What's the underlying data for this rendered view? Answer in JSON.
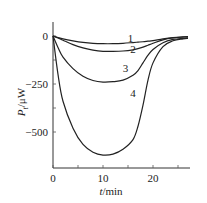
{
  "chart_data": {
    "type": "line",
    "title": "",
    "xlabel": "t/min",
    "ylabel": "P_t/μW",
    "xlim": [
      0,
      27
    ],
    "ylim": [
      -660,
      80
    ],
    "x_ticks": [
      "0",
      "10",
      "20"
    ],
    "y_ticks": [
      "0",
      "-250",
      "-500"
    ],
    "grid": false,
    "legend": "inline curve labels 1-4",
    "x": [
      0,
      1,
      2,
      4,
      6,
      8,
      10,
      12,
      14,
      16,
      17,
      18,
      19,
      20,
      22,
      24,
      26,
      27
    ],
    "series": [
      {
        "name": "1",
        "values": [
          0,
          -8,
          -15,
          -25,
          -33,
          -38,
          -40,
          -40,
          -38,
          -34,
          -32,
          -30,
          -27,
          -24,
          -15,
          -8,
          -4,
          -3
        ]
      },
      {
        "name": "2",
        "values": [
          0,
          -10,
          -22,
          -45,
          -62,
          -74,
          -80,
          -80,
          -78,
          -72,
          -66,
          -58,
          -48,
          -38,
          -20,
          -10,
          -6,
          -5
        ]
      },
      {
        "name": "3",
        "values": [
          0,
          -60,
          -110,
          -170,
          -210,
          -232,
          -240,
          -238,
          -230,
          -205,
          -180,
          -140,
          -100,
          -70,
          -35,
          -18,
          -12,
          -10
        ]
      },
      {
        "name": "4",
        "values": [
          0,
          -200,
          -340,
          -480,
          -565,
          -605,
          -620,
          -615,
          -590,
          -540,
          -470,
          -360,
          -230,
          -140,
          -55,
          -25,
          -15,
          -12
        ]
      }
    ],
    "curve_labels": [
      {
        "text": "1",
        "t": 15.5,
        "p": -30
      },
      {
        "text": "2",
        "t": 16,
        "p": -90
      },
      {
        "text": "3",
        "t": 14.5,
        "p": -190
      },
      {
        "text": "4",
        "t": 16,
        "p": -320
      }
    ]
  },
  "labels": {
    "xlabel_italic": "t",
    "xlabel_unit": "/min",
    "ylabel_italic": "P",
    "ylabel_sub": "t",
    "ylabel_unit": "/μW"
  }
}
